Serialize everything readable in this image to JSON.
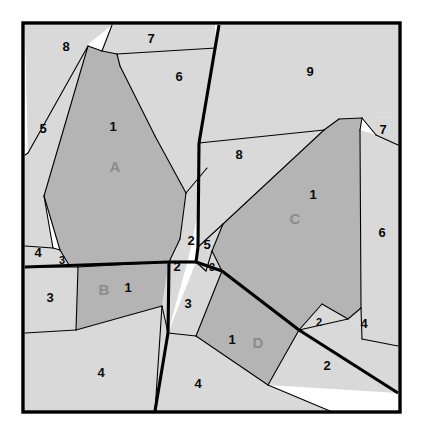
{
  "figure": {
    "canvas": {
      "width": 422,
      "height": 436
    },
    "frame": {
      "x": 23,
      "y": 23,
      "width": 377,
      "height": 389
    },
    "colors": {
      "background": "#ffffff",
      "region_light": "#d9d9d9",
      "region_highlight": "#b4b4b4",
      "edge": "#000000",
      "number_label": "#0a0a0a",
      "letter_label": "#8c8c8c"
    },
    "line_widths": {
      "frame": 3.4,
      "thick": 3.1,
      "thin": 1.1
    }
  },
  "regions": [
    {
      "id": "region-8-topleft",
      "label": "8",
      "kind": "light",
      "points": "25,25 112,25 87,45 28,153",
      "label_pos": {
        "x": 66,
        "y": 48
      }
    },
    {
      "id": "region-5-left",
      "label": "5",
      "kind": "light",
      "points": "25,25 28,153 25,155 25,246 53,248 44,196 88,46",
      "label_pos": {
        "x": 43,
        "y": 130
      }
    },
    {
      "id": "region-7-top",
      "label": "7",
      "kind": "light",
      "points": "112,25 215,25 216,48 117,54 102,51",
      "label_pos": {
        "x": 151,
        "y": 40
      }
    },
    {
      "id": "region-6-upper",
      "label": "6",
      "kind": "light",
      "points": "117,54 216,48 217,75 207,168 186,193 155,136 120,66",
      "label_pos": {
        "x": 179,
        "y": 78
      }
    },
    {
      "id": "region-4-leftlow",
      "label": "4",
      "kind": "light",
      "points": "25,246 25,267 56,266 60,250 53,248",
      "label_pos": {
        "x": 38,
        "y": 254
      }
    },
    {
      "id": "region-3-leftsmall",
      "label": "3",
      "kind": "light",
      "points": "53,248 60,250 69,265 56,266",
      "label_pos": {
        "x": 62,
        "y": 261
      }
    },
    {
      "id": "region-A",
      "label": "A",
      "number": "1",
      "kind": "dark",
      "points": "102,51 117,54 120,66 155,136 186,193 180,239 169,262 69,265 60,250 44,196 88,46",
      "label_pos": {
        "x": 115,
        "y": 168
      },
      "number_pos": {
        "x": 113,
        "y": 128
      }
    },
    {
      "id": "region-2-midupper",
      "label": "2",
      "kind": "light",
      "points": "186,193 207,168 189,256 180,239",
      "label_pos": {
        "x": 191,
        "y": 242
      }
    },
    {
      "id": "region-2-midlower",
      "label": "2",
      "kind": "light",
      "points": "169,262 180,239 189,256 168,333 162,306",
      "label_pos": {
        "x": 177,
        "y": 268
      }
    },
    {
      "id": "region-3-lowleft",
      "label": "3",
      "kind": "light",
      "points": "25,267 78,267 76,330 25,333",
      "label_pos": {
        "x": 50,
        "y": 299
      }
    },
    {
      "id": "region-B",
      "label": "B",
      "number": "1",
      "kind": "dark",
      "points": "78,267 169,262 162,306 76,330",
      "label_pos": {
        "x": 104,
        "y": 291
      },
      "number_pos": {
        "x": 128,
        "y": 289
      }
    },
    {
      "id": "region-4-bottomleft",
      "label": "4",
      "kind": "light",
      "points": "25,333 76,330 162,306 155,411 25,411",
      "label_pos": {
        "x": 101,
        "y": 374
      }
    },
    {
      "id": "region-9-topright",
      "label": "9",
      "kind": "light",
      "points": "219,25 398,25 398,117 339,119 324,130 199,143",
      "label_pos": {
        "x": 310,
        "y": 73
      }
    },
    {
      "id": "region-7-right",
      "label": "7",
      "kind": "light",
      "points": "362,118 398,117 398,145 376,135",
      "label_pos": {
        "x": 383,
        "y": 131
      }
    },
    {
      "id": "region-8-mid",
      "label": "8",
      "kind": "light",
      "points": "199,143 324,130 223,224 198,247",
      "label_pos": {
        "x": 239,
        "y": 156
      }
    },
    {
      "id": "region-C",
      "label": "C",
      "number": "1",
      "kind": "dark",
      "points": "324,130 339,119 362,118 360,130 361,308 348,319 299,330 222,271 212,251 223,224",
      "label_pos": {
        "x": 295,
        "y": 220
      },
      "number_pos": {
        "x": 313,
        "y": 196
      }
    },
    {
      "id": "region-6-right",
      "label": "6",
      "kind": "light",
      "points": "376,135 398,145 398,346 362,339 361,308 360,130",
      "label_pos": {
        "x": 382,
        "y": 234
      }
    },
    {
      "id": "region-5-mid",
      "label": "5",
      "kind": "light",
      "points": "198,247 223,224 212,251 206,271 196,262",
      "label_pos": {
        "x": 207,
        "y": 246
      }
    },
    {
      "id": "region-3-midsmall",
      "label": "3",
      "kind": "light",
      "points": "206,271 212,251 222,271",
      "label_pos": {
        "x": 212,
        "y": 268
      }
    },
    {
      "id": "region-3-midlower",
      "label": "3",
      "kind": "light",
      "points": "196,262 206,271 222,271 196,336 168,333",
      "label_pos": {
        "x": 188,
        "y": 305
      }
    },
    {
      "id": "region-D",
      "label": "D",
      "number": "1",
      "kind": "dark",
      "points": "196,336 222,271 299,330 268,385",
      "label_pos": {
        "x": 258,
        "y": 344
      },
      "number_pos": {
        "x": 232,
        "y": 341
      }
    },
    {
      "id": "region-2-lowright",
      "label": "2",
      "kind": "light",
      "points": "299,330 348,319 398,346 398,393 268,385",
      "label_pos": {
        "x": 327,
        "y": 367
      }
    },
    {
      "id": "region-4-rightmid",
      "label": "4",
      "kind": "light",
      "points": "348,319 361,308 362,339 398,346",
      "label_pos": {
        "x": 364,
        "y": 325
      }
    },
    {
      "id": "region-2-rightsmall",
      "label": "2",
      "kind": "light",
      "points": "299,330 322,304 348,319",
      "label_pos": {
        "x": 319,
        "y": 323
      }
    },
    {
      "id": "region-4-bottommid",
      "label": "4",
      "kind": "light",
      "points": "155,411 162,306 168,333 196,336 268,385 330,411",
      "label_pos": {
        "x": 198,
        "y": 385
      }
    }
  ],
  "thin_edges": [
    "28,153 88,46",
    "25,155 28,153",
    "44,196 88,46",
    "53,248 44,196",
    "25,246 53,248",
    "53,248 60,250",
    "60,250 69,265",
    "60,250 44,196",
    "102,51 112,25",
    "117,54 102,51",
    "120,66 117,54",
    "155,136 120,66",
    "186,193 155,136",
    "117,54 216,48",
    "186,193 207,168",
    "180,239 186,193",
    "169,262 180,239",
    "102,51 88,46",
    "25,267 78,267",
    "78,267 169,262",
    "78,267 76,330",
    "76,330 162,306",
    "25,333 76,330",
    "199,143 324,130",
    "324,130 223,224",
    "223,224 212,251",
    "212,251 222,271",
    "206,271 212,251",
    "196,262 206,271",
    "198,247 223,224",
    "339,119 324,130",
    "362,118 339,119",
    "376,135 362,118",
    "398,145 376,135",
    "360,130 362,118",
    "361,308 360,130",
    "362,339 361,308",
    "398,346 362,339",
    "348,319 361,308",
    "299,330 348,319",
    "322,304 299,330",
    "348,319 322,304",
    "222,271 299,330",
    "299,330 268,385",
    "196,336 268,385",
    "268,385 330,411",
    "168,333 196,336",
    "196,336 222,271",
    "162,306 168,333",
    "155,411 162,306"
  ],
  "thick_edges": [
    "219,25 199,143",
    "199,143 198,247",
    "198,247 196,262",
    "196,262 169,262",
    "25,267 169,262",
    "169,262 168,333",
    "168,333 155,411",
    "196,262 222,271",
    "222,271 299,330",
    "299,330 398,393"
  ]
}
